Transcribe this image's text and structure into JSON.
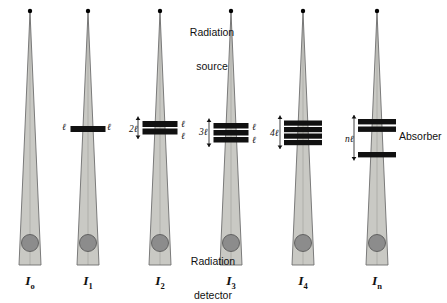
{
  "diagram": {
    "background_color": "#ffffff",
    "beam_fill_color": "#c9c9c4",
    "beam_edge_color": "#6e6e6e",
    "detector_color": "#8c8c8c",
    "detector_edge_color": "#5a5a5a",
    "absorber_color": "#111111",
    "source_dot_color": "#000000"
  },
  "annotations": {
    "source_label": "Radiation\nsource",
    "source_label_line1": "Radiation",
    "source_label_line2": "source",
    "detector_label_line1": "Radiation",
    "detector_label_line2": "detector",
    "absorber_label": "Absorber"
  },
  "columns": [
    {
      "id": "col-0",
      "intensity_symbol": "I",
      "intensity_subscript": "o",
      "intensity_label": "Io",
      "center_x": 30,
      "num_absorber_layers": 0,
      "thickness_label": "",
      "right_labels": [],
      "left_label": ""
    },
    {
      "id": "col-1",
      "intensity_symbol": "I",
      "intensity_subscript": "1",
      "intensity_label": "I1",
      "center_x": 88,
      "num_absorber_layers": 1,
      "thickness_label": "ℓ",
      "right_labels": [
        "ℓ"
      ],
      "left_label": "ℓ"
    },
    {
      "id": "col-2",
      "intensity_symbol": "I",
      "intensity_subscript": "2",
      "intensity_label": "I2",
      "center_x": 160,
      "num_absorber_layers": 2,
      "thickness_label": "2ℓ",
      "right_labels": [
        "ℓ",
        "ℓ"
      ],
      "left_label": "2ℓ"
    },
    {
      "id": "col-3",
      "intensity_symbol": "I",
      "intensity_subscript": "3",
      "intensity_label": "I3",
      "center_x": 231,
      "num_absorber_layers": 3,
      "thickness_label": "3ℓ",
      "right_labels": [
        "ℓ",
        "ℓ"
      ],
      "left_label": "3ℓ"
    },
    {
      "id": "col-4",
      "intensity_symbol": "I",
      "intensity_subscript": "4",
      "intensity_label": "I4",
      "center_x": 303,
      "num_absorber_layers": 4,
      "thickness_label": "4ℓ",
      "right_labels": [],
      "left_label": "4ℓ"
    },
    {
      "id": "col-n",
      "intensity_symbol": "I",
      "intensity_subscript": "n",
      "intensity_label": "In",
      "center_x": 377,
      "num_absorber_layers": 3,
      "thickness_label": "nℓ",
      "right_labels": [],
      "left_label": "nℓ"
    }
  ]
}
